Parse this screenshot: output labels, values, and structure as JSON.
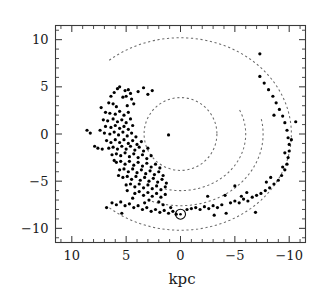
{
  "figure": {
    "kind": "galactic-plane-scatter",
    "background_color": "#ffffff",
    "point_color": "#000000",
    "curve_color": "#6b6b6b",
    "axis_color": "#3a3a3a"
  },
  "axes": {
    "x_title": "kpc",
    "y_title": "",
    "x_tick_labels": [
      "10",
      "5",
      "0",
      "−5",
      "−10"
    ],
    "x_tick_values": [
      10,
      5,
      0,
      -5,
      -10
    ],
    "y_tick_labels": [
      "10",
      "5",
      "0",
      "−5",
      "−10"
    ],
    "y_tick_values": [
      10,
      5,
      0,
      -5,
      -10
    ],
    "x_inverted": true,
    "minor_ticks_per_interval": 5
  },
  "markers": {
    "sun": {
      "symbol": "sun-symbol",
      "x": 0,
      "y": -8.5,
      "outer_radius_px": 5.0,
      "inner_radius_px": 1.3
    }
  },
  "chart_data": {
    "type": "scatter",
    "title": "",
    "subtitle": "",
    "xlabel": "kpc",
    "ylabel": "",
    "xlim": [
      11.5,
      -11.5
    ],
    "ylim": [
      -11.5,
      11.5
    ],
    "grid": false,
    "legend": "none",
    "axis_x_inverted": true,
    "marker_size_px": 1.6,
    "series": [
      {
        "name": "tracers",
        "marker": "dot",
        "color": "#000000",
        "points": [
          [
            5.6,
            5.0
          ],
          [
            5.1,
            4.6
          ],
          [
            4.8,
            4.7
          ],
          [
            4.6,
            4.3
          ],
          [
            6.1,
            4.4
          ],
          [
            3.4,
            4.9
          ],
          [
            2.6,
            4.6
          ],
          [
            5.0,
            4.0
          ],
          [
            5.3,
            3.9
          ],
          [
            4.5,
            3.7
          ],
          [
            6.6,
            3.3
          ],
          [
            6.2,
            3.2
          ],
          [
            5.9,
            2.9
          ],
          [
            4.9,
            3.0
          ],
          [
            4.3,
            3.2
          ],
          [
            6.9,
            2.3
          ],
          [
            6.5,
            2.2
          ],
          [
            6.0,
            2.1
          ],
          [
            5.6,
            2.4
          ],
          [
            5.2,
            2.0
          ],
          [
            4.8,
            2.3
          ],
          [
            7.1,
            1.5
          ],
          [
            6.7,
            1.4
          ],
          [
            6.2,
            1.6
          ],
          [
            5.8,
            1.3
          ],
          [
            5.4,
            1.5
          ],
          [
            5.0,
            1.2
          ],
          [
            4.6,
            1.6
          ],
          [
            6.9,
            0.8
          ],
          [
            6.4,
            0.7
          ],
          [
            6.0,
            0.9
          ],
          [
            5.6,
            0.6
          ],
          [
            5.2,
            0.8
          ],
          [
            4.8,
            0.5
          ],
          [
            4.4,
            0.9
          ],
          [
            8.3,
            0.1
          ],
          [
            7.0,
            0.1
          ],
          [
            6.5,
            0.0
          ],
          [
            6.1,
            0.2
          ],
          [
            5.7,
            -0.1
          ],
          [
            5.3,
            0.2
          ],
          [
            4.9,
            -0.2
          ],
          [
            4.5,
            0.1
          ],
          [
            4.1,
            -0.3
          ],
          [
            7.6,
            -1.5
          ],
          [
            7.2,
            -1.6
          ],
          [
            6.8,
            -0.7
          ],
          [
            6.4,
            -0.9
          ],
          [
            6.0,
            -0.6
          ],
          [
            5.6,
            -0.9
          ],
          [
            5.2,
            -0.6
          ],
          [
            4.8,
            -1.0
          ],
          [
            4.4,
            -0.7
          ],
          [
            4.0,
            -1.1
          ],
          [
            3.6,
            -0.8
          ],
          [
            6.6,
            -1.5
          ],
          [
            6.2,
            -1.4
          ],
          [
            5.8,
            -1.6
          ],
          [
            5.4,
            -1.3
          ],
          [
            5.0,
            -1.6
          ],
          [
            4.6,
            -1.3
          ],
          [
            4.2,
            -1.7
          ],
          [
            3.8,
            -1.4
          ],
          [
            3.4,
            -1.8
          ],
          [
            3.0,
            -1.5
          ],
          [
            6.3,
            -2.2
          ],
          [
            5.9,
            -2.1
          ],
          [
            5.5,
            -2.3
          ],
          [
            5.1,
            -2.0
          ],
          [
            4.7,
            -2.4
          ],
          [
            4.3,
            -2.1
          ],
          [
            3.9,
            -2.5
          ],
          [
            3.5,
            -2.2
          ],
          [
            3.1,
            -2.6
          ],
          [
            2.7,
            -2.3
          ],
          [
            1.1,
            -0.1
          ],
          [
            5.9,
            -3.0
          ],
          [
            5.5,
            -2.9
          ],
          [
            5.1,
            -3.2
          ],
          [
            4.7,
            -2.9
          ],
          [
            4.3,
            -3.3
          ],
          [
            3.9,
            -3.0
          ],
          [
            3.5,
            -3.4
          ],
          [
            3.1,
            -3.1
          ],
          [
            2.7,
            -3.5
          ],
          [
            2.3,
            -3.2
          ],
          [
            1.9,
            -3.6
          ],
          [
            5.6,
            -3.8
          ],
          [
            5.2,
            -3.7
          ],
          [
            4.8,
            -4.0
          ],
          [
            4.4,
            -3.7
          ],
          [
            4.0,
            -4.1
          ],
          [
            3.6,
            -3.8
          ],
          [
            3.2,
            -4.2
          ],
          [
            2.8,
            -3.9
          ],
          [
            2.4,
            -4.3
          ],
          [
            2.0,
            -4.0
          ],
          [
            1.6,
            -4.4
          ],
          [
            5.3,
            -4.6
          ],
          [
            4.9,
            -4.5
          ],
          [
            4.5,
            -4.8
          ],
          [
            4.1,
            -4.5
          ],
          [
            3.7,
            -4.9
          ],
          [
            3.3,
            -4.6
          ],
          [
            2.9,
            -5.0
          ],
          [
            2.5,
            -4.7
          ],
          [
            2.1,
            -5.1
          ],
          [
            1.7,
            -4.8
          ],
          [
            1.3,
            -5.2
          ],
          [
            5.0,
            -5.4
          ],
          [
            4.6,
            -5.3
          ],
          [
            4.2,
            -5.6
          ],
          [
            3.8,
            -5.3
          ],
          [
            3.4,
            -5.7
          ],
          [
            3.0,
            -5.4
          ],
          [
            2.6,
            -5.8
          ],
          [
            2.2,
            -5.5
          ],
          [
            1.8,
            -5.9
          ],
          [
            1.4,
            -5.6
          ],
          [
            4.2,
            -6.3
          ],
          [
            3.8,
            -6.1
          ],
          [
            3.4,
            -6.5
          ],
          [
            3.0,
            -6.2
          ],
          [
            2.6,
            -6.6
          ],
          [
            2.2,
            -6.3
          ],
          [
            1.8,
            -6.7
          ],
          [
            1.4,
            -6.4
          ],
          [
            6.3,
            -7.3
          ],
          [
            5.9,
            -7.5
          ],
          [
            5.5,
            -7.2
          ],
          [
            5.1,
            -7.6
          ],
          [
            4.7,
            -7.4
          ],
          [
            4.3,
            -7.8
          ],
          [
            3.9,
            -7.6
          ],
          [
            3.5,
            -8.0
          ],
          [
            3.1,
            -7.8
          ],
          [
            2.7,
            -8.2
          ],
          [
            2.3,
            -8.0
          ],
          [
            1.9,
            -8.3
          ],
          [
            1.5,
            -8.1
          ],
          [
            1.1,
            -8.4
          ],
          [
            0.7,
            -8.2
          ],
          [
            -0.6,
            -8.0
          ],
          [
            -1.0,
            -7.9
          ],
          [
            -1.4,
            -7.8
          ],
          [
            -1.8,
            -8.0
          ],
          [
            -2.2,
            -7.7
          ],
          [
            -2.6,
            -7.9
          ],
          [
            -3.0,
            -7.6
          ],
          [
            -3.4,
            -7.8
          ],
          [
            -3.8,
            -7.5
          ],
          [
            -4.2,
            -8.4
          ],
          [
            -4.6,
            -7.3
          ],
          [
            -5.0,
            -7.1
          ],
          [
            -5.4,
            -7.3
          ],
          [
            -5.8,
            -6.9
          ],
          [
            -6.2,
            -7.1
          ],
          [
            -6.6,
            -6.7
          ],
          [
            -7.0,
            -6.5
          ],
          [
            -7.4,
            -6.3
          ],
          [
            -7.8,
            -6.0
          ],
          [
            -8.2,
            -5.7
          ],
          [
            -8.6,
            -5.3
          ],
          [
            -9.0,
            -4.9
          ],
          [
            -9.3,
            -4.4
          ],
          [
            -9.6,
            -3.8
          ],
          [
            -9.8,
            -3.2
          ],
          [
            -9.9,
            -2.5
          ],
          [
            -10.0,
            -1.8
          ],
          [
            -10.0,
            -1.1
          ],
          [
            -9.9,
            -0.4
          ],
          [
            -9.8,
            0.4
          ],
          [
            -9.6,
            1.2
          ],
          [
            -9.4,
            1.9
          ],
          [
            -9.1,
            2.6
          ],
          [
            -8.8,
            3.3
          ],
          [
            -8.5,
            4.0
          ],
          [
            -8.1,
            4.7
          ],
          [
            -7.7,
            5.4
          ],
          [
            -7.3,
            6.1
          ],
          [
            -7.3,
            8.5
          ],
          [
            -10.6,
            1.3
          ],
          [
            -8.6,
            2.0
          ],
          [
            -5.0,
            -5.5
          ],
          [
            -4.1,
            -6.5
          ],
          [
            -2.5,
            -6.6
          ],
          [
            -8.3,
            -4.6
          ],
          [
            -7.9,
            -5.1
          ],
          [
            -6.1,
            -6.2
          ],
          [
            -5.6,
            -6.6
          ],
          [
            -9.4,
            -3.5
          ],
          [
            -9.6,
            -2.0
          ],
          [
            -10.2,
            -0.6
          ],
          [
            -6.9,
            -8.3
          ],
          [
            -3.1,
            -8.6
          ],
          [
            7.9,
            -1.3
          ],
          [
            8.6,
            0.4
          ],
          [
            3.9,
            4.5
          ],
          [
            3.0,
            4.2
          ],
          [
            5.8,
            4.8
          ],
          [
            6.4,
            4.0
          ],
          [
            7.3,
            2.8
          ],
          [
            7.4,
            0.4
          ],
          [
            6.1,
            -2.8
          ],
          [
            5.7,
            -4.4
          ],
          [
            4.9,
            -6.0
          ],
          [
            4.4,
            -6.8
          ],
          [
            3.3,
            -7.3
          ],
          [
            2.9,
            -7.0
          ],
          [
            2.0,
            -7.2
          ],
          [
            1.6,
            -7.5
          ],
          [
            0.9,
            -7.8
          ],
          [
            0.4,
            -8.5
          ],
          [
            6.8,
            -7.8
          ],
          [
            5.4,
            -8.4
          ]
        ]
      }
    ],
    "curves": [
      {
        "name": "molecular-ring",
        "kind": "circle",
        "center": [
          0.0,
          0.0
        ],
        "radius": 3.35,
        "style": "dashed"
      },
      {
        "name": "inner-spiral-arm",
        "kind": "dashed-arc",
        "center": [
          0.0,
          0.0
        ],
        "radius": 6.0,
        "start_angle_deg": 155,
        "end_angle_deg": 285,
        "style": "dashed"
      },
      {
        "name": "middle-spiral-arm",
        "kind": "dashed-arc",
        "center": [
          0.0,
          0.0
        ],
        "radius": 7.6,
        "start_angle_deg": 168,
        "end_angle_deg": 292,
        "style": "dashed"
      },
      {
        "name": "outer-spiral-arm",
        "kind": "dashed-arc",
        "center": [
          0.0,
          0.0
        ],
        "radius": 10.2,
        "start_angle_deg": 50,
        "end_angle_deg": 310,
        "style": "dashed"
      }
    ]
  }
}
